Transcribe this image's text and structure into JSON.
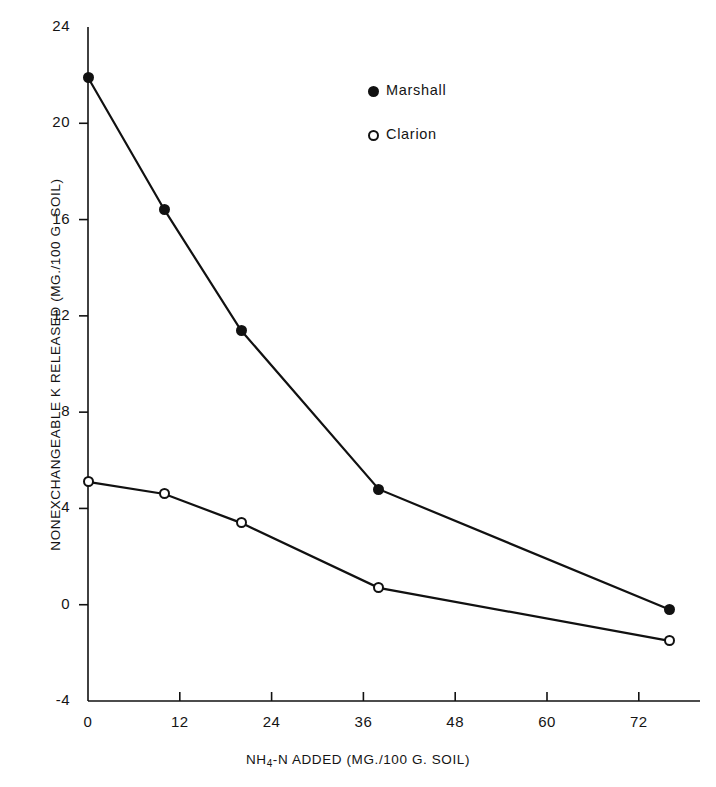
{
  "chart_data": {
    "type": "line",
    "title": "",
    "xlabel": "NH4-N ADDED  (MG./100 G. SOIL)",
    "xlabel_prefix": "NH",
    "xlabel_sub": "4",
    "xlabel_suffix": "-N ADDED  (MG./100 G. SOIL)",
    "ylabel": "NONEXCHANGEABLE K RELEASED (MG./100 G. SOIL)",
    "xlim": [
      0,
      80
    ],
    "ylim": [
      -4,
      24
    ],
    "xticks": [
      "0",
      "12",
      "24",
      "36",
      "48",
      "60",
      "72"
    ],
    "xtick_values": [
      0,
      12,
      24,
      36,
      48,
      60,
      72
    ],
    "yticks": [
      "24",
      "20",
      "16",
      "12",
      "8",
      "4",
      "0",
      "-4"
    ],
    "ytick_values": [
      24,
      20,
      16,
      12,
      8,
      4,
      0,
      -4
    ],
    "grid": false,
    "legend_position": "upper-center",
    "x": [
      0,
      10,
      20,
      38,
      76
    ],
    "series": [
      {
        "name": "Marshall",
        "marker": "filled-circle",
        "color": "#111111",
        "values": [
          21.9,
          16.4,
          11.4,
          4.8,
          -0.2
        ]
      },
      {
        "name": "Clarion",
        "marker": "open-circle",
        "color": "#111111",
        "values": [
          5.1,
          4.6,
          3.4,
          0.7,
          -1.5
        ]
      }
    ]
  },
  "legend": {
    "items": [
      {
        "label": "Marshall",
        "marker": "filled-circle"
      },
      {
        "label": "Clarion",
        "marker": "open-circle"
      }
    ]
  }
}
